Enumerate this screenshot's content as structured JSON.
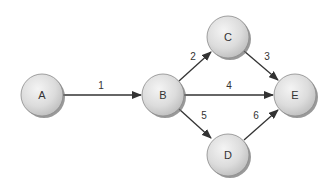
{
  "diagram": {
    "type": "network-graph",
    "nodes": [
      {
        "id": "A",
        "label": "A",
        "x": 42,
        "y": 95
      },
      {
        "id": "B",
        "label": "B",
        "x": 163,
        "y": 95
      },
      {
        "id": "C",
        "label": "C",
        "x": 228,
        "y": 37
      },
      {
        "id": "D",
        "label": "D",
        "x": 228,
        "y": 155
      },
      {
        "id": "E",
        "label": "E",
        "x": 295,
        "y": 95
      }
    ],
    "edges": [
      {
        "from": "A",
        "to": "B",
        "label": "1"
      },
      {
        "from": "B",
        "to": "C",
        "label": "2"
      },
      {
        "from": "C",
        "to": "E",
        "label": "3"
      },
      {
        "from": "B",
        "to": "E",
        "label": "4"
      },
      {
        "from": "B",
        "to": "D",
        "label": "5"
      },
      {
        "from": "D",
        "to": "E",
        "label": "6"
      }
    ]
  },
  "colors": {
    "node_fill_light": "#f2f2f2",
    "node_fill_dark": "#c4c4c4",
    "node_shadow": "#6e6e6e",
    "node_stroke": "#8a8a8a",
    "edge": "#333333"
  }
}
